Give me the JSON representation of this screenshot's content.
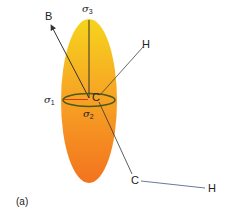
{
  "figure": {
    "panel_label": "(a)",
    "labels": {
      "sigma3": {
        "symbol": "σ",
        "subscript": "3"
      },
      "sigma1": {
        "symbol": "σ",
        "subscript": "1"
      },
      "sigma2": {
        "symbol": "σ",
        "subscript": "2"
      },
      "B": "B",
      "H_upper": "H",
      "C_center": "C",
      "C_lower": "C",
      "H_lower": "H"
    },
    "colors": {
      "ellipsoid_top": "#f6d41c",
      "ellipsoid_mid": "#f7a624",
      "ellipsoid_bottom": "#f3731f",
      "ring": "#4a5a1a",
      "sigma1_axis": "#d83a10",
      "bond_line": "#333333",
      "ch_bond": "#6a7a9a"
    }
  }
}
